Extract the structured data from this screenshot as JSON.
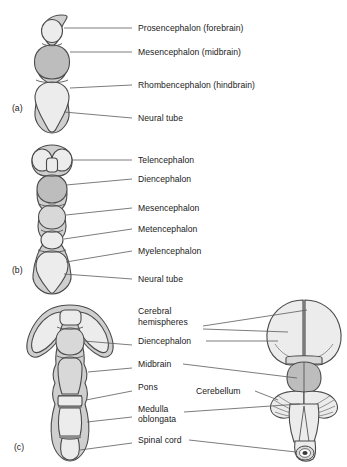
{
  "figure": {
    "type": "anatomical-diagram",
    "panels": [
      {
        "tag": "(a)",
        "tag_x": 12,
        "tag_y": 108,
        "stage": "three-vesicle stage",
        "labels": [
          {
            "text": "Prosencephalon (forebrain)",
            "x": 138,
            "y": 23,
            "line_x1": 132,
            "line_y1": 28,
            "line_x2": 72,
            "line_y2": 28
          },
          {
            "text": "Mesencephalon (midbrain)",
            "x": 138,
            "y": 47,
            "line_x1": 132,
            "line_y1": 52,
            "line_x2": 78,
            "line_y2": 52
          },
          {
            "text": "Rhombencephalon (hindbrain)",
            "x": 138,
            "y": 80,
            "line_x1": 132,
            "line_y1": 85,
            "line_x2": 80,
            "line_y2": 85
          },
          {
            "text": "Neural tube",
            "x": 138,
            "y": 113,
            "line_x1": 132,
            "line_y1": 118,
            "line_x2": 70,
            "line_y2": 118
          }
        ]
      },
      {
        "tag": "(b)",
        "tag_x": 12,
        "tag_y": 270,
        "stage": "five-vesicle stage",
        "labels": [
          {
            "text": "Telencephalon",
            "x": 138,
            "y": 155,
            "line_x1": 132,
            "line_y1": 160,
            "line_x2": 80,
            "line_y2": 160
          },
          {
            "text": "Diencephalon",
            "x": 138,
            "y": 174,
            "line_x1": 132,
            "line_y1": 179,
            "line_x2": 76,
            "line_y2": 179
          },
          {
            "text": "Mesencephalon",
            "x": 138,
            "y": 203,
            "line_x1": 132,
            "line_y1": 208,
            "line_x2": 76,
            "line_y2": 208
          },
          {
            "text": "Metencephalon",
            "x": 138,
            "y": 224,
            "line_x1": 132,
            "line_y1": 229,
            "line_x2": 72,
            "line_y2": 229
          },
          {
            "text": "Myelencephalon",
            "x": 138,
            "y": 246,
            "line_x1": 132,
            "line_y1": 251,
            "line_x2": 78,
            "line_y2": 251
          },
          {
            "text": "Neural tube",
            "x": 138,
            "y": 274,
            "line_x1": 132,
            "line_y1": 279,
            "line_x2": 70,
            "line_y2": 279
          }
        ]
      },
      {
        "tag": "(c)",
        "tag_x": 14,
        "tag_y": 447,
        "stage": "mature brain",
        "labels": [
          {
            "text": "Cerebral",
            "x": 138,
            "y": 312
          },
          {
            "text": "hemispheres",
            "x": 138,
            "y": 322
          },
          {
            "text": "Diencephalon",
            "x": 138,
            "y": 345
          },
          {
            "text": "Midbrain",
            "x": 138,
            "y": 368
          },
          {
            "text": "Pons",
            "x": 138,
            "y": 391
          },
          {
            "text": "Cerebellum",
            "x": 196,
            "y": 394
          },
          {
            "text": "Medulla",
            "x": 138,
            "y": 412
          },
          {
            "text": "oblongata",
            "x": 138,
            "y": 422
          },
          {
            "text": "Spinal cord",
            "x": 138,
            "y": 443
          }
        ]
      }
    ]
  },
  "colors": {
    "outline": "#4a4a4a",
    "fill_light": "#ececec",
    "fill_mid": "#d8d8d8",
    "fill_dark": "#bdbdbd",
    "fill_rim": "#cfcfcf",
    "leader": "#5a5a5a",
    "text": "#1a1a1a",
    "background": "#ffffff"
  }
}
